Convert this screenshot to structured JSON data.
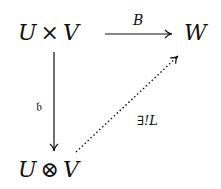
{
  "diagram": {
    "type": "commutative-diagram",
    "nodes": {
      "top_left": {
        "left": "U",
        "op": "×",
        "right": "V"
      },
      "top_right": {
        "text": "W"
      },
      "bottom_left": {
        "left": "U",
        "op": "⊗",
        "right": "V"
      }
    },
    "arrows": {
      "top": {
        "label": "B",
        "style": "solid"
      },
      "left": {
        "label": "𝔟",
        "style": "solid"
      },
      "diagonal": {
        "label": "∃!L",
        "style": "dotted"
      }
    }
  }
}
